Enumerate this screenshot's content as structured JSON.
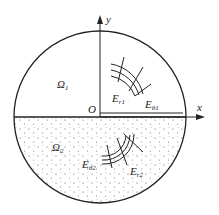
{
  "diagram": {
    "type": "cylindrical two-region field diagram",
    "axes": {
      "x_label": "x",
      "y_label": "y",
      "origin_label": "O"
    },
    "regions": [
      {
        "id": "upper",
        "label": "Ω",
        "subscript": "1",
        "fill": "blank"
      },
      {
        "id": "lower",
        "label": "Ω",
        "subscript": "2",
        "fill": "dotted"
      }
    ],
    "field_labels": [
      {
        "base": "E",
        "sub": "r1"
      },
      {
        "base": "E",
        "sub": "θ1"
      },
      {
        "base": "E",
        "sub": "θ2"
      },
      {
        "base": "E",
        "sub": "r2"
      }
    ]
  }
}
